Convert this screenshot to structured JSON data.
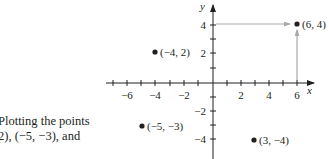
{
  "caption": {
    "line1": "Plotting the points",
    "line2": "2), (−5, −3), and"
  },
  "axes": {
    "x_label": "x",
    "y_label": "y",
    "x_ticks": [
      "−6",
      "−4",
      "−2",
      "2",
      "4",
      "6"
    ],
    "y_ticks": [
      "4",
      "2",
      "−2",
      "−4"
    ]
  },
  "points": [
    {
      "label": "(6, 4)",
      "x": 6,
      "y": 4
    },
    {
      "label": "(−4, 2)",
      "x": -4,
      "y": 2
    },
    {
      "label": "(−5, −3)",
      "x": -5,
      "y": -3
    },
    {
      "label": "(3, −4)",
      "x": 3,
      "y": -4
    }
  ],
  "colors": {
    "ink": "#231f20",
    "guide_arrow": "#a7a9ac"
  }
}
